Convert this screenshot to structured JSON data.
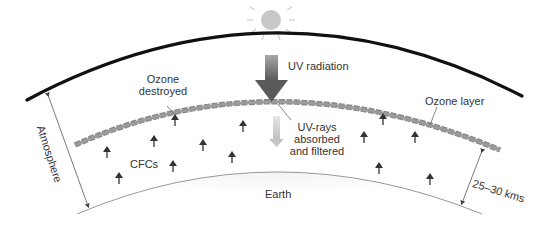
{
  "diagram": {
    "labels": {
      "uv_radiation": "UV radiation",
      "ozone_destroyed_line1": "Ozone",
      "ozone_destroyed_line2": "destroyed",
      "ozone_layer": "Ozone layer",
      "uv_rays_line1": "UV-rays",
      "uv_rays_line2": "absorbed",
      "uv_rays_line3": "and filtered",
      "cfcs": "CFCs",
      "atmosphere": "Atmosphere",
      "earth": "Earth",
      "distance": "25–30 kms"
    },
    "icons": {
      "sun": "sun-icon",
      "uv_arrow": "big-down-arrow",
      "filtered_arrow": "light-down-arrow",
      "cfc_arrows": "small-up-arrow"
    },
    "colors": {
      "atmosphere_line": "#111111",
      "ozone_layer": "#8a8a8a",
      "sun": "#c8c8c8",
      "uv_arrow": "#7a7a7a",
      "filtered_arrow": "#d6d6d6",
      "cfc_arrow": "#333333",
      "earth_line": "#999999",
      "text": "#333333"
    }
  }
}
